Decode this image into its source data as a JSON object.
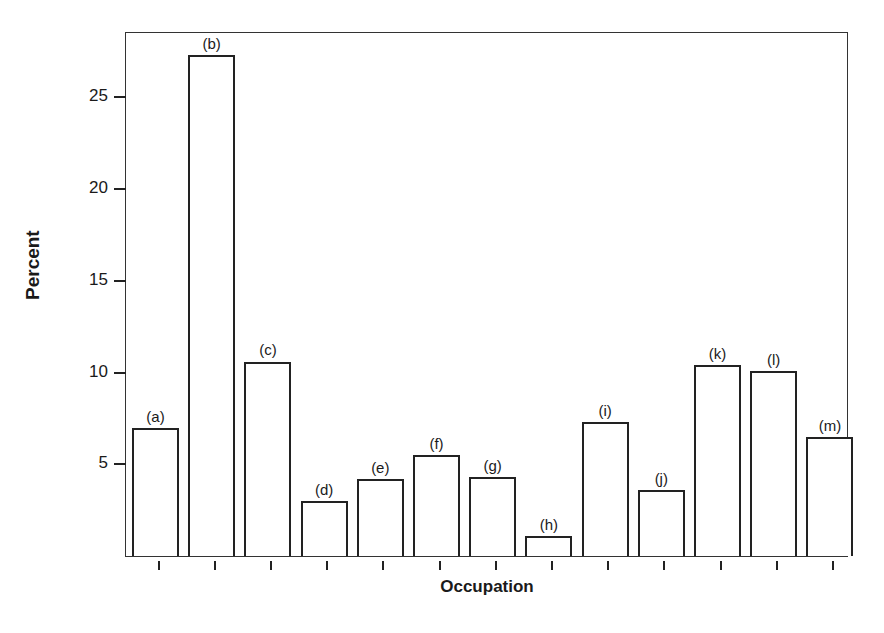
{
  "chart_data": {
    "type": "bar",
    "title": "",
    "xlabel": "Occupation",
    "ylabel": "Percent",
    "categories": [
      "(a)",
      "(b)",
      "(c)",
      "(d)",
      "(e)",
      "(f)",
      "(g)",
      "(h)",
      "(i)",
      "(j)",
      "(k)",
      "(l)",
      "(m)"
    ],
    "values": [
      7.0,
      27.3,
      10.6,
      3.0,
      4.2,
      5.5,
      4.3,
      1.1,
      7.3,
      3.6,
      10.4,
      10.1,
      6.5
    ],
    "yticks": [
      5,
      10,
      15,
      20,
      25
    ],
    "ylim": [
      0,
      28.5
    ],
    "grid": false,
    "legend": null
  }
}
